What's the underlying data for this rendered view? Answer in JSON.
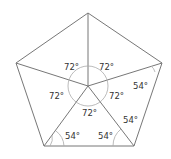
{
  "diagram": {
    "line_color": "#777777",
    "vertices": {
      "top": [
        88,
        13
      ],
      "right": [
        162,
        63
      ],
      "bottom_right": [
        134,
        146
      ],
      "bottom_left": [
        44,
        146
      ],
      "left": [
        16,
        63
      ],
      "center": [
        88,
        86
      ]
    },
    "center_angle_labels": {
      "upper_left": "72°",
      "upper_right": "72°",
      "left": "72°",
      "right": "72°",
      "bottom": "72°"
    },
    "base_angle_labels": {
      "right_vertex": "54°",
      "bottom_right_upper": "54°",
      "bottom_right_left": "54°",
      "bottom_left": "54°"
    }
  }
}
